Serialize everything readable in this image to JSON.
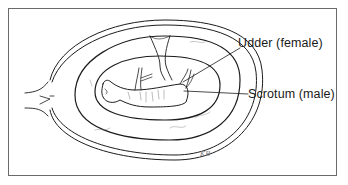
{
  "figure": {
    "labels": [
      {
        "id": "udder",
        "text": "Udder (female)"
      },
      {
        "id": "scrotum",
        "text": "Scrotum (male)"
      }
    ],
    "signature": "KB"
  }
}
